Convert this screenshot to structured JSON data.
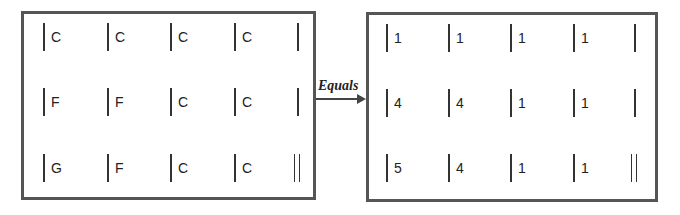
{
  "left_grid": {
    "rows": [
      [
        "C",
        "C",
        "C",
        "C"
      ],
      [
        "F",
        "F",
        "C",
        "C"
      ],
      [
        "G",
        "F",
        "C",
        "C"
      ]
    ]
  },
  "arrow": {
    "label": "Equals"
  },
  "right_grid": {
    "rows": [
      [
        "1",
        "1",
        "1",
        "1"
      ],
      [
        "4",
        "4",
        "1",
        "1"
      ],
      [
        "5",
        "4",
        "1",
        "1"
      ]
    ]
  }
}
